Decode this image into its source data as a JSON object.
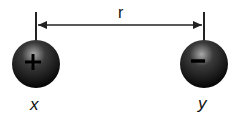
{
  "diagram": {
    "distance_label": "r",
    "charges": [
      {
        "id": "x",
        "label": "x",
        "sign": "+",
        "type": "positive"
      },
      {
        "id": "y",
        "label": "y",
        "sign": "−",
        "type": "negative"
      }
    ],
    "colors": {
      "sphere_dark": "#0a0a0a",
      "sphere_highlight": "#9a9a9a",
      "line": "#222222"
    }
  }
}
